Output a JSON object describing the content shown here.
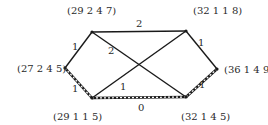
{
  "diagram": {
    "nodes": [
      {
        "id": "A",
        "label": "(29 2 4 7)",
        "x": 92,
        "y": 32,
        "lx": 67,
        "ly": 14
      },
      {
        "id": "B",
        "label": "(32 1 1 8)",
        "x": 186,
        "y": 31,
        "lx": 193,
        "ly": 14
      },
      {
        "id": "C",
        "label": "(27 2 4 5)",
        "x": 65,
        "y": 68,
        "lx": 17,
        "ly": 72
      },
      {
        "id": "D",
        "label": "(36 1 4 9)",
        "x": 217,
        "y": 69,
        "lx": 224,
        "ly": 73
      },
      {
        "id": "E",
        "label": "(29 1 1 5)",
        "x": 92,
        "y": 98,
        "lx": 53,
        "ly": 120
      },
      {
        "id": "F",
        "label": "(32 1 4 5)",
        "x": 186,
        "y": 97,
        "lx": 181,
        "ly": 120
      }
    ],
    "edges": [
      {
        "from": "A",
        "to": "B",
        "weight": "2",
        "dashed": false,
        "lx": 136,
        "ly": 27
      },
      {
        "from": "A",
        "to": "C",
        "weight": "1",
        "dashed": false,
        "lx": 72,
        "ly": 50
      },
      {
        "from": "A",
        "to": "F",
        "weight": "2",
        "dashed": false,
        "lx": 108,
        "ly": 54
      },
      {
        "from": "B",
        "to": "E",
        "weight": "1",
        "dashed": false,
        "lx": 120,
        "ly": 90
      },
      {
        "from": "B",
        "to": "D",
        "weight": "1",
        "dashed": false,
        "lx": 198,
        "ly": 46
      },
      {
        "from": "C",
        "to": "E",
        "weight": "1",
        "dashed": true,
        "lx": 72,
        "ly": 92
      },
      {
        "from": "E",
        "to": "F",
        "weight": "0",
        "dashed": true,
        "lx": 138,
        "ly": 111
      },
      {
        "from": "F",
        "to": "D",
        "weight": "1",
        "dashed": true,
        "lx": 199,
        "ly": 88
      }
    ]
  }
}
